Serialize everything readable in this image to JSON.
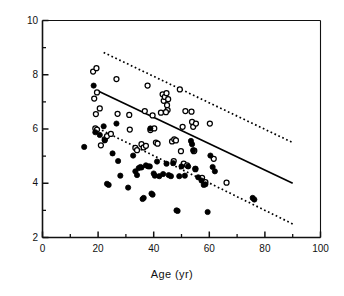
{
  "chart_data": {
    "type": "scatter",
    "title": "",
    "xlabel": "Age  (yr)",
    "ylabel": "",
    "xlim": [
      0,
      100
    ],
    "ylim": [
      2,
      10
    ],
    "xticks": [
      0,
      20,
      40,
      60,
      80,
      100
    ],
    "xticks_minor": [
      10,
      30,
      50,
      70,
      90
    ],
    "yticks": [
      2,
      4,
      6,
      8,
      10
    ],
    "yticks_minor": [
      3,
      5,
      7,
      9
    ],
    "xtick_labels": [
      "0",
      "20",
      "40",
      "60",
      "80",
      "100"
    ],
    "ytick_labels": [
      "2",
      "4",
      "6",
      "8",
      "10"
    ],
    "grid": false,
    "legend": "none",
    "frame": "full-box",
    "series": [
      {
        "name": "open-circles",
        "marker": "open-circle",
        "color": "#000000",
        "fill": "#ffffff",
        "points": [
          [
            18.2,
            8.12
          ],
          [
            19.4,
            8.24
          ],
          [
            18.6,
            7.12
          ],
          [
            19.6,
            7.35
          ],
          [
            20.6,
            6.76
          ],
          [
            19.2,
            6.55
          ],
          [
            19.0,
            6.02
          ],
          [
            19.6,
            5.98
          ],
          [
            21.0,
            5.4
          ],
          [
            22.4,
            5.62
          ],
          [
            23.2,
            5.74
          ],
          [
            24.6,
            5.82
          ],
          [
            26.6,
            7.84
          ],
          [
            27.0,
            6.56
          ],
          [
            31.2,
            6.52
          ],
          [
            31.4,
            5.98
          ],
          [
            33.4,
            5.3
          ],
          [
            34.0,
            5.22
          ],
          [
            35.6,
            5.44
          ],
          [
            36.4,
            5.32
          ],
          [
            36.8,
            6.66
          ],
          [
            37.2,
            5.38
          ],
          [
            37.8,
            7.6
          ],
          [
            38.8,
            5.96
          ],
          [
            39.6,
            6.5
          ],
          [
            40.2,
            6.02
          ],
          [
            40.8,
            5.5
          ],
          [
            41.4,
            5.46
          ],
          [
            42.6,
            6.6
          ],
          [
            43.2,
            7.28
          ],
          [
            43.6,
            7.04
          ],
          [
            44.0,
            7.18
          ],
          [
            44.6,
            7.32
          ],
          [
            44.8,
            6.88
          ],
          [
            45.2,
            7.1
          ],
          [
            45.0,
            6.7
          ],
          [
            44.4,
            6.62
          ],
          [
            46.6,
            5.54
          ],
          [
            47.4,
            5.62
          ],
          [
            47.2,
            4.82
          ],
          [
            48.0,
            5.58
          ],
          [
            49.4,
            7.46
          ],
          [
            49.8,
            5.18
          ],
          [
            50.4,
            6.08
          ],
          [
            50.8,
            4.72
          ],
          [
            51.4,
            6.66
          ],
          [
            52.0,
            4.66
          ],
          [
            53.6,
            6.64
          ],
          [
            53.8,
            6.26
          ],
          [
            54.2,
            6.08
          ],
          [
            54.4,
            5.18
          ],
          [
            54.6,
            5.2
          ],
          [
            55.2,
            6.2
          ],
          [
            55.0,
            4.52
          ],
          [
            57.4,
            4.2
          ],
          [
            58.6,
            4.04
          ],
          [
            60.2,
            6.2
          ],
          [
            61.6,
            4.9
          ],
          [
            66.2,
            4.02
          ]
        ]
      },
      {
        "name": "filled-circles",
        "marker": "filled-circle",
        "color": "#000000",
        "fill": "#000000",
        "points": [
          [
            15.0,
            5.34
          ],
          [
            18.4,
            7.6
          ],
          [
            19.0,
            5.88
          ],
          [
            20.6,
            5.78
          ],
          [
            22.0,
            6.1
          ],
          [
            22.4,
            5.58
          ],
          [
            23.2,
            3.98
          ],
          [
            23.8,
            3.94
          ],
          [
            25.2,
            5.1
          ],
          [
            26.6,
            6.2
          ],
          [
            27.2,
            4.82
          ],
          [
            28.0,
            4.28
          ],
          [
            30.8,
            3.84
          ],
          [
            32.6,
            5.02
          ],
          [
            33.4,
            4.44
          ],
          [
            34.0,
            4.3
          ],
          [
            34.6,
            4.56
          ],
          [
            35.2,
            4.6
          ],
          [
            35.6,
            4.58
          ],
          [
            36.0,
            3.42
          ],
          [
            36.4,
            3.46
          ],
          [
            37.2,
            4.66
          ],
          [
            38.0,
            4.62
          ],
          [
            38.6,
            4.62
          ],
          [
            38.8,
            6.02
          ],
          [
            39.2,
            3.62
          ],
          [
            39.6,
            3.58
          ],
          [
            40.0,
            4.36
          ],
          [
            40.4,
            4.28
          ],
          [
            41.2,
            4.8
          ],
          [
            42.0,
            4.26
          ],
          [
            43.4,
            4.34
          ],
          [
            44.6,
            4.72
          ],
          [
            45.4,
            4.3
          ],
          [
            46.2,
            4.26
          ],
          [
            47.0,
            4.74
          ],
          [
            48.2,
            3.0
          ],
          [
            48.6,
            2.98
          ],
          [
            49.2,
            4.26
          ],
          [
            50.0,
            4.62
          ],
          [
            51.2,
            4.28
          ],
          [
            52.4,
            4.62
          ],
          [
            53.4,
            5.56
          ],
          [
            53.8,
            5.44
          ],
          [
            54.2,
            5.22
          ],
          [
            55.0,
            4.54
          ],
          [
            56.0,
            4.22
          ],
          [
            57.2,
            4.1
          ],
          [
            58.0,
            3.94
          ],
          [
            58.6,
            3.96
          ],
          [
            59.4,
            2.94
          ],
          [
            60.4,
            5.02
          ],
          [
            61.2,
            4.6
          ],
          [
            62.0,
            4.44
          ],
          [
            75.6,
            3.46
          ],
          [
            76.2,
            3.4
          ]
        ]
      }
    ],
    "lines": [
      {
        "name": "upper-prediction-limit",
        "style": "dotted",
        "color": "#000000",
        "x": [
          22.0,
          90.0
        ],
        "y": [
          8.82,
          5.5
        ]
      },
      {
        "name": "regression-line",
        "style": "solid",
        "color": "#000000",
        "x": [
          20.0,
          90.0
        ],
        "y": [
          7.4,
          4.0
        ]
      },
      {
        "name": "lower-prediction-limit",
        "style": "dotted",
        "color": "#000000",
        "x": [
          20.0,
          90.0
        ],
        "y": [
          6.02,
          2.5
        ]
      }
    ]
  }
}
